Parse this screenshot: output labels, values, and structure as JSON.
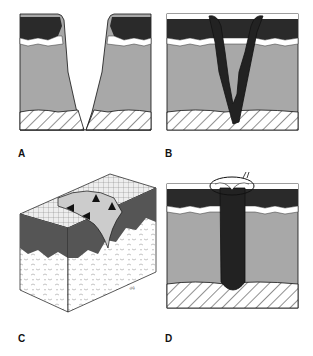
{
  "figure": {
    "panels": [
      {
        "id": "A",
        "label": "A",
        "description": "Skin cross-section with V-shaped open wound through epidermis and dermis"
      },
      {
        "id": "B",
        "label": "B",
        "description": "V-shaped wound filled with dark clot/granulation tissue"
      },
      {
        "id": "C",
        "label": "C",
        "description": "3D block of skin showing healing incision with arrows indicating wound contraction"
      },
      {
        "id": "D",
        "label": "D",
        "description": "Narrow sutured wound filled with dark tissue, suture loop at surface"
      }
    ],
    "layers": [
      "stratum corneum",
      "epidermis",
      "basal cell layer",
      "dermis",
      "subcutaneous tissue"
    ],
    "colors": {
      "corneum": "#ffffff",
      "epidermis": "#2a2a2a",
      "dermis": "#a8a8a8",
      "clot": "#222222",
      "outline": "#111111"
    }
  }
}
